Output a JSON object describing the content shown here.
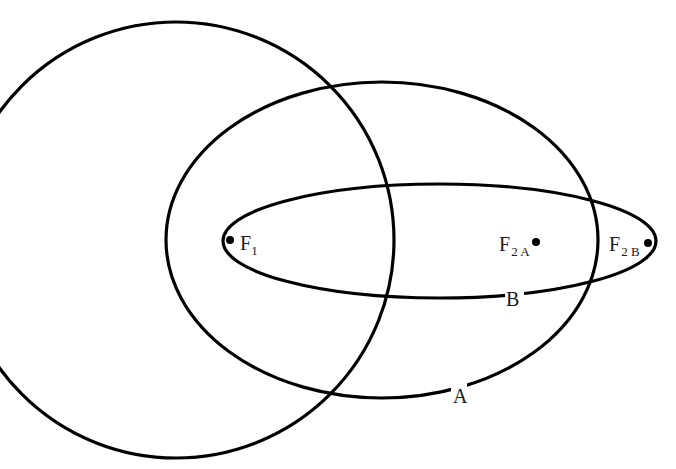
{
  "diagram": {
    "type": "orbital-ellipses-with-shared-focus",
    "colors": {
      "stroke": "#000000",
      "background": "#ffffff",
      "text": "#1a1a1a"
    },
    "circle": {
      "cx": 176,
      "cy": 240,
      "r": 218
    },
    "ellipse_a": {
      "cx": 382,
      "cy": 240,
      "rx": 216,
      "ry": 158,
      "label": "A"
    },
    "ellipse_b": {
      "cx": 439.5,
      "cy": 241,
      "rx": 216.5,
      "ry": 57,
      "label": "B"
    },
    "foci": [
      {
        "id": "F1",
        "x": 230,
        "y": 240,
        "main": "F",
        "sub": "1"
      },
      {
        "id": "F2A",
        "x": 536,
        "y": 242,
        "main": "F",
        "sub": "2 A"
      },
      {
        "id": "F2B",
        "x": 648,
        "y": 243,
        "main": "F",
        "sub": "2 B"
      }
    ]
  }
}
